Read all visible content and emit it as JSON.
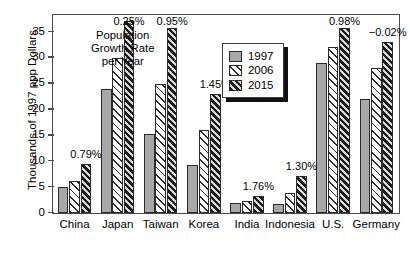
{
  "chart_data": {
    "type": "bar",
    "title": "",
    "xlabel": "",
    "ylabel": "Thousands of 1997 ppp Dollars",
    "ylim": [
      0,
      38
    ],
    "yticks": [
      0,
      5,
      10,
      15,
      20,
      25,
      30,
      35
    ],
    "grid": false,
    "legend_position": "upper-center-right",
    "categories": [
      "China",
      "Japan",
      "Taiwan",
      "Korea",
      "India",
      "Indonesia",
      "U.S.",
      "Germany"
    ],
    "series": [
      {
        "name": "1997",
        "values": [
          5.0,
          24.0,
          15.3,
          9.3,
          1.9,
          1.8,
          29.0,
          22.0
        ]
      },
      {
        "name": "2006",
        "values": [
          6.2,
          30.0,
          25.0,
          16.0,
          2.3,
          3.9,
          32.0,
          28.0
        ]
      },
      {
        "name": "2015",
        "values": [
          9.4,
          37.0,
          35.7,
          23.0,
          3.3,
          7.1,
          35.7,
          33.0
        ]
      }
    ],
    "annotations": [
      {
        "category": "China",
        "text": "0.79%"
      },
      {
        "category": "Japan",
        "text": "0.25%"
      },
      {
        "category": "Taiwan",
        "text": "0.95%"
      },
      {
        "category": "Korea",
        "text": "1.45%"
      },
      {
        "category": "India",
        "text": "1.76%"
      },
      {
        "category": "Indonesia",
        "text": "1.30%"
      },
      {
        "category": "U.S.",
        "text": "0.98%"
      },
      {
        "category": "Germany",
        "text": "−0.02%"
      }
    ],
    "note": "Population\nGrowth Rate\nper Year",
    "colors": {
      "series_1997": "#a8a8a8",
      "series_2006": "#ffffff",
      "series_2015": "#1c1c1c",
      "axis": "#4a4a4a",
      "text": "#000000"
    }
  }
}
